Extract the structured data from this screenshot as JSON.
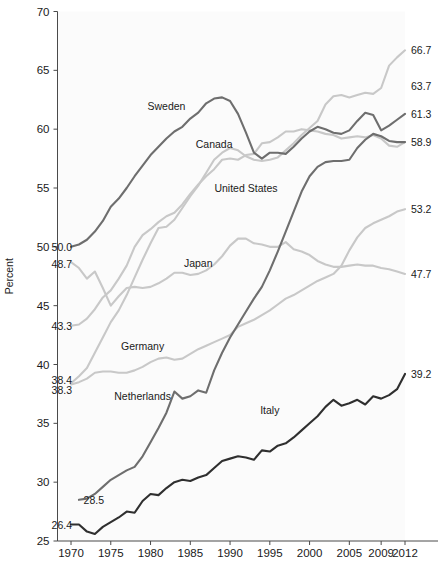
{
  "chart_data": {
    "type": "line",
    "title": "",
    "xlabel": "",
    "ylabel": "Percent",
    "ylim": [
      25,
      70
    ],
    "xlim": [
      1968,
      2012
    ],
    "grid": false,
    "legend": "inline-labels",
    "y_ticks": [
      25,
      30,
      35,
      40,
      45,
      50,
      55,
      60,
      65,
      70
    ],
    "x_ticks": [
      1970,
      1975,
      1980,
      1985,
      1990,
      1995,
      2000,
      2005,
      2009,
      2012
    ],
    "series": [
      {
        "name": "Sweden",
        "color": "#6e6e6e",
        "label_x": 1982,
        "label_y": 61.6,
        "start_label": "50.0",
        "end_label": "63.7",
        "x": [
          1970,
          1971,
          1972,
          1973,
          1974,
          1975,
          1976,
          1977,
          1978,
          1979,
          1980,
          1981,
          1982,
          1983,
          1984,
          1985,
          1986,
          1987,
          1988,
          1989,
          1990,
          1991,
          1992,
          1993,
          1994,
          1995,
          1996,
          1997,
          1998,
          1999,
          2000,
          2001,
          2002,
          2003,
          2004,
          2005,
          2006,
          2007,
          2008,
          2009,
          2010,
          2011,
          2012
        ],
        "values": [
          50.0,
          50.2,
          50.6,
          51.3,
          52.2,
          53.4,
          54.1,
          55.0,
          56.0,
          56.9,
          57.8,
          58.5,
          59.2,
          59.8,
          60.2,
          60.9,
          61.4,
          62.2,
          62.6,
          62.7,
          62.4,
          61.3,
          59.7,
          58.0,
          57.5,
          58.0,
          58.0,
          57.9,
          58.5,
          59.2,
          59.8,
          60.2,
          60.0,
          59.7,
          59.6,
          59.9,
          60.7,
          61.4,
          61.2,
          59.9,
          60.3,
          60.8,
          61.3
        ]
      },
      {
        "name": "Canada",
        "color": "#c8c8c8",
        "label_x": 1988,
        "label_y": 58.4,
        "start_label": "38.4",
        "end_label": "66.7",
        "x": [
          1970,
          1971,
          1972,
          1973,
          1974,
          1975,
          1976,
          1977,
          1978,
          1979,
          1980,
          1981,
          1982,
          1983,
          1984,
          1985,
          1986,
          1987,
          1988,
          1989,
          1990,
          1991,
          1992,
          1993,
          1994,
          1995,
          1996,
          1997,
          1998,
          1999,
          2000,
          2001,
          2002,
          2003,
          2004,
          2005,
          2006,
          2007,
          2008,
          2009,
          2010,
          2011,
          2012
        ],
        "values": [
          38.4,
          39.0,
          39.7,
          41.0,
          42.3,
          43.6,
          44.6,
          45.9,
          47.4,
          48.9,
          50.3,
          51.6,
          51.7,
          52.3,
          53.3,
          54.3,
          55.2,
          56.3,
          57.4,
          58.0,
          58.4,
          58.2,
          57.7,
          57.4,
          57.3,
          57.4,
          57.6,
          58.2,
          58.8,
          59.5,
          60.1,
          60.7,
          62.1,
          62.8,
          62.9,
          62.7,
          62.9,
          63.1,
          63.0,
          63.5,
          65.4,
          66.1,
          66.7
        ]
      },
      {
        "name": "United States",
        "color": "#c8c8c8",
        "label_x": 1992,
        "label_y": 54.7,
        "start_label": "43.3",
        "end_label": "58.9",
        "x": [
          1970,
          1971,
          1972,
          1973,
          1974,
          1975,
          1976,
          1977,
          1978,
          1979,
          1980,
          1981,
          1982,
          1983,
          1984,
          1985,
          1986,
          1987,
          1988,
          1989,
          1990,
          1991,
          1992,
          1993,
          1994,
          1995,
          1996,
          1997,
          1998,
          1999,
          2000,
          2001,
          2002,
          2003,
          2004,
          2005,
          2006,
          2007,
          2008,
          2009,
          2010,
          2011,
          2012
        ],
        "values": [
          43.3,
          43.4,
          43.9,
          44.7,
          45.7,
          46.3,
          47.3,
          48.4,
          50.0,
          51.0,
          51.5,
          52.1,
          52.6,
          52.9,
          53.6,
          54.5,
          55.3,
          56.0,
          56.6,
          57.4,
          57.5,
          57.4,
          57.8,
          57.9,
          58.8,
          58.9,
          59.3,
          59.8,
          59.8,
          60.0,
          59.9,
          59.8,
          59.6,
          59.5,
          59.2,
          59.3,
          59.4,
          59.3,
          59.5,
          59.2,
          58.6,
          58.5,
          58.9
        ]
      },
      {
        "name": "Japan",
        "color": "#c8c8c8",
        "label_x": 1986,
        "label_y": 48.3,
        "start_label": "48.7",
        "end_label": "47.7",
        "x": [
          1970,
          1971,
          1972,
          1973,
          1974,
          1975,
          1976,
          1977,
          1978,
          1979,
          1980,
          1981,
          1982,
          1983,
          1984,
          1985,
          1986,
          1987,
          1988,
          1989,
          1990,
          1991,
          1992,
          1993,
          1994,
          1995,
          1996,
          1997,
          1998,
          1999,
          2000,
          2001,
          2002,
          2003,
          2004,
          2005,
          2006,
          2007,
          2008,
          2009,
          2010,
          2011,
          2012
        ],
        "values": [
          48.7,
          48.2,
          47.3,
          47.9,
          46.5,
          45.0,
          45.8,
          46.5,
          46.6,
          46.5,
          46.6,
          46.9,
          47.3,
          47.8,
          47.8,
          47.6,
          47.7,
          48.0,
          48.5,
          49.2,
          50.1,
          50.7,
          50.7,
          50.3,
          50.2,
          50.0,
          50.0,
          50.4,
          49.8,
          49.6,
          49.3,
          48.8,
          48.5,
          48.3,
          48.3,
          48.4,
          48.5,
          48.4,
          48.4,
          48.2,
          48.1,
          47.9,
          47.7
        ]
      },
      {
        "name": "Germany",
        "color": "#c8c8c8",
        "label_x": 1979,
        "label_y": 41.2,
        "start_label": "38.3",
        "end_label": "53.2",
        "x": [
          1970,
          1971,
          1972,
          1973,
          1974,
          1975,
          1976,
          1977,
          1978,
          1979,
          1980,
          1981,
          1982,
          1983,
          1984,
          1985,
          1986,
          1987,
          1988,
          1989,
          1990,
          1991,
          1992,
          1993,
          1994,
          1995,
          1996,
          1997,
          1998,
          1999,
          2000,
          2001,
          2002,
          2003,
          2004,
          2005,
          2006,
          2007,
          2008,
          2009,
          2010,
          2011,
          2012
        ],
        "values": [
          38.3,
          38.5,
          38.8,
          39.3,
          39.4,
          39.4,
          39.3,
          39.3,
          39.5,
          39.8,
          40.2,
          40.5,
          40.6,
          40.4,
          40.5,
          40.9,
          41.3,
          41.6,
          41.9,
          42.2,
          42.5,
          43.2,
          43.5,
          43.8,
          44.2,
          44.6,
          45.1,
          45.6,
          45.9,
          46.3,
          46.7,
          47.1,
          47.4,
          47.7,
          48.4,
          49.7,
          50.8,
          51.6,
          52.0,
          52.3,
          52.6,
          53.0,
          53.2
        ]
      },
      {
        "name": "Netherlands",
        "color": "#6e6e6e",
        "label_x": 1979,
        "label_y": 37.0,
        "start_label": "28.5",
        "end_label": "58.9",
        "x": [
          1971,
          1972,
          1973,
          1974,
          1975,
          1976,
          1977,
          1978,
          1979,
          1980,
          1981,
          1982,
          1983,
          1984,
          1985,
          1986,
          1987,
          1988,
          1989,
          1990,
          1991,
          1992,
          1993,
          1994,
          1995,
          1996,
          1997,
          1998,
          1999,
          2000,
          2001,
          2002,
          2003,
          2004,
          2005,
          2006,
          2007,
          2008,
          2009,
          2010,
          2011,
          2012
        ],
        "values": [
          28.5,
          28.6,
          29.0,
          29.6,
          30.2,
          30.6,
          31.0,
          31.3,
          32.2,
          33.4,
          34.6,
          35.9,
          37.7,
          37.1,
          37.3,
          37.8,
          37.6,
          39.5,
          41.0,
          42.3,
          43.4,
          44.5,
          45.6,
          46.6,
          48.0,
          49.6,
          51.3,
          53.0,
          54.7,
          56.0,
          56.8,
          57.2,
          57.3,
          57.3,
          57.4,
          58.4,
          59.1,
          59.6,
          59.4,
          59.0,
          58.9,
          58.9
        ]
      },
      {
        "name": "Italy",
        "color": "#2f2f2f",
        "label_x": 1995,
        "label_y": 35.8,
        "start_label": "26.4",
        "end_label": "39.2",
        "x": [
          1970,
          1971,
          1972,
          1973,
          1974,
          1975,
          1976,
          1977,
          1978,
          1979,
          1980,
          1981,
          1982,
          1983,
          1984,
          1985,
          1986,
          1987,
          1988,
          1989,
          1990,
          1991,
          1992,
          1993,
          1994,
          1995,
          1996,
          1997,
          1998,
          1999,
          2000,
          2001,
          2002,
          2003,
          2004,
          2005,
          2006,
          2007,
          2008,
          2009,
          2010,
          2011,
          2012
        ],
        "values": [
          26.4,
          26.4,
          25.8,
          25.6,
          26.2,
          26.6,
          27.0,
          27.5,
          27.4,
          28.4,
          29.0,
          28.9,
          29.5,
          30.0,
          30.2,
          30.1,
          30.4,
          30.6,
          31.2,
          31.8,
          32.0,
          32.2,
          32.1,
          31.9,
          32.7,
          32.6,
          33.1,
          33.3,
          33.8,
          34.4,
          35.0,
          35.6,
          36.4,
          37.0,
          36.5,
          36.7,
          37.0,
          36.6,
          37.3,
          37.1,
          37.4,
          37.9,
          39.2
        ]
      }
    ],
    "start_value_labels": [
      {
        "text": "50.0",
        "year": 1970,
        "value": 50.0
      },
      {
        "text": "48.7",
        "year": 1970,
        "value": 48.7
      },
      {
        "text": "43.3",
        "year": 1970,
        "value": 43.3
      },
      {
        "text": "38.4",
        "year": 1970,
        "value": 38.4
      },
      {
        "text": "38.3",
        "year": 1970,
        "value": 38.3
      },
      {
        "text": "28.5",
        "year": 1971,
        "value": 28.5
      },
      {
        "text": "26.4",
        "year": 1970,
        "value": 26.4
      }
    ],
    "end_value_labels": [
      {
        "text": "66.7",
        "year": 2012,
        "value": 66.7
      },
      {
        "text": "63.7",
        "year": 2012,
        "value": 63.7
      },
      {
        "text": "61.3",
        "year": 2012,
        "value": 61.3
      },
      {
        "text": "58.9",
        "year": 2012,
        "value": 58.9
      },
      {
        "text": "53.2",
        "year": 2012,
        "value": 53.2
      },
      {
        "text": "47.7",
        "year": 2012,
        "value": 47.7
      },
      {
        "text": "39.2",
        "year": 2012,
        "value": 39.2
      }
    ]
  },
  "source_note": ""
}
